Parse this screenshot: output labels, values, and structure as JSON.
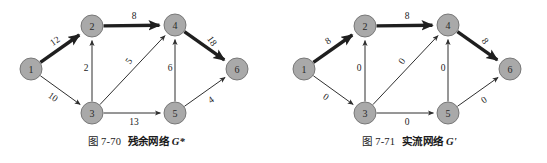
{
  "page": {
    "background": "#ffffff",
    "node_fill": "#a9a9a9",
    "node_stroke": "#6f6f6f",
    "edge_color": "#2f2f2f",
    "bold_edge_color": "#1f1f1f"
  },
  "figures": [
    {
      "id": "figure-left",
      "caption_number": "图 7-70",
      "caption_title": "残余网络",
      "caption_symbol": "G*",
      "nodes": [
        {
          "id": "n1",
          "label": "1",
          "x": 31,
          "y": 69
        },
        {
          "id": "n2",
          "label": "2",
          "x": 92,
          "y": 26
        },
        {
          "id": "n3",
          "label": "3",
          "x": 92,
          "y": 113
        },
        {
          "id": "n4",
          "label": "4",
          "x": 175,
          "y": 25
        },
        {
          "id": "n5",
          "label": "5",
          "x": 175,
          "y": 113
        },
        {
          "id": "n6",
          "label": "6",
          "x": 237,
          "y": 69
        }
      ],
      "edges": [
        {
          "from": "n1",
          "to": "n2",
          "label": "12",
          "bold": true,
          "lx": 55,
          "ly": 41,
          "rot": -35
        },
        {
          "from": "n1",
          "to": "n3",
          "label": "10",
          "bold": false,
          "lx": 53,
          "ly": 97,
          "rot": 35
        },
        {
          "from": "n2",
          "to": "n4",
          "label": "8",
          "bold": true,
          "lx": 134,
          "ly": 16,
          "rot": 0
        },
        {
          "from": "n3",
          "to": "n2",
          "label": "2",
          "bold": false,
          "lx": 86,
          "ly": 68,
          "rot": 0
        },
        {
          "from": "n3",
          "to": "n4",
          "label": "5",
          "bold": false,
          "lx": 129,
          "ly": 61,
          "rot": -55
        },
        {
          "from": "n3",
          "to": "n5",
          "label": "13",
          "bold": false,
          "lx": 134,
          "ly": 122,
          "rot": 0
        },
        {
          "from": "n5",
          "to": "n4",
          "label": "6",
          "bold": false,
          "lx": 170,
          "ly": 68,
          "rot": 0
        },
        {
          "from": "n5",
          "to": "n6",
          "label": "4",
          "bold": false,
          "lx": 211,
          "ly": 100,
          "rot": -35
        },
        {
          "from": "n4",
          "to": "n6",
          "label": "18",
          "bold": true,
          "lx": 212,
          "ly": 41,
          "rot": 55
        }
      ]
    },
    {
      "id": "figure-right",
      "caption_number": "图 7-71",
      "caption_title": "实流网络",
      "caption_symbol": "G'",
      "nodes": [
        {
          "id": "n1",
          "label": "1",
          "x": 31,
          "y": 69
        },
        {
          "id": "n2",
          "label": "2",
          "x": 92,
          "y": 26
        },
        {
          "id": "n3",
          "label": "3",
          "x": 92,
          "y": 113
        },
        {
          "id": "n4",
          "label": "4",
          "x": 175,
          "y": 25
        },
        {
          "id": "n5",
          "label": "5",
          "x": 175,
          "y": 113
        },
        {
          "id": "n6",
          "label": "6",
          "x": 237,
          "y": 69
        }
      ],
      "edges": [
        {
          "from": "n1",
          "to": "n2",
          "label": "8",
          "bold": true,
          "lx": 55,
          "ly": 41,
          "rot": -35
        },
        {
          "from": "n1",
          "to": "n3",
          "label": "0",
          "bold": false,
          "lx": 53,
          "ly": 97,
          "rot": 35
        },
        {
          "from": "n2",
          "to": "n4",
          "label": "8",
          "bold": true,
          "lx": 134,
          "ly": 16,
          "rot": 0
        },
        {
          "from": "n3",
          "to": "n2",
          "label": "0",
          "bold": false,
          "lx": 86,
          "ly": 68,
          "rot": 0
        },
        {
          "from": "n3",
          "to": "n4",
          "label": "0",
          "bold": false,
          "lx": 129,
          "ly": 61,
          "rot": -55
        },
        {
          "from": "n3",
          "to": "n5",
          "label": "0",
          "bold": false,
          "lx": 134,
          "ly": 122,
          "rot": 0
        },
        {
          "from": "n5",
          "to": "n4",
          "label": "0",
          "bold": false,
          "lx": 170,
          "ly": 68,
          "rot": 0
        },
        {
          "from": "n5",
          "to": "n6",
          "label": "0",
          "bold": false,
          "lx": 211,
          "ly": 100,
          "rot": -35
        },
        {
          "from": "n4",
          "to": "n6",
          "label": "8",
          "bold": true,
          "lx": 212,
          "ly": 41,
          "rot": 55
        }
      ]
    }
  ]
}
